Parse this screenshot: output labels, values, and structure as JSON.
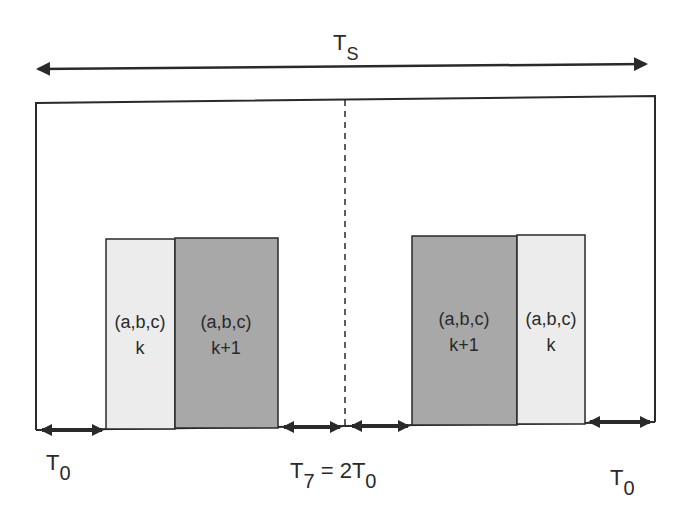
{
  "diagram": {
    "period_label": {
      "main": "T",
      "sub": "S"
    },
    "left_block": {
      "slot1": {
        "line1": "(a,b,c)",
        "line2": "k",
        "fill": "#ececec"
      },
      "slot2": {
        "line1": "(a,b,c)",
        "line2": "k+1",
        "fill": "#a8a8a8"
      }
    },
    "right_block": {
      "slot1": {
        "line1": "(a,b,c)",
        "line2": "k+1",
        "fill": "#a8a8a8"
      },
      "slot2": {
        "line1": "(a,b,c)",
        "line2": "k",
        "fill": "#ececec"
      }
    },
    "bottom_labels": {
      "left": {
        "main": "T",
        "sub": "0"
      },
      "middle": {
        "main": "T",
        "sub": "7",
        "eq": " = 2T",
        "sub2": "0"
      },
      "right": {
        "main": "T",
        "sub": "0"
      }
    },
    "colors": {
      "line": "#2a2a2a",
      "light_slot": "#ececec",
      "dark_slot": "#a8a8a8"
    }
  }
}
